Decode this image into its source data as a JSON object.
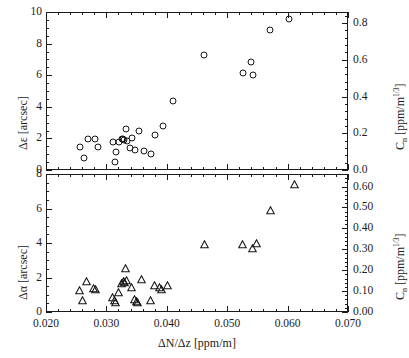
{
  "figure": {
    "background": "#ffffff",
    "foreground": "#1a1a1a"
  },
  "chart_data": [
    {
      "type": "scatter",
      "panel": "top",
      "title": "",
      "xlabel": "",
      "ylabel": "Δε [arcsec]",
      "y2label": "C_n [ppm/m^(1/3)]",
      "marker": "open-circle",
      "xlim": [
        0.02,
        0.07
      ],
      "ylim": [
        0,
        10
      ],
      "y2lim": [
        0.0,
        0.86
      ],
      "grid": false,
      "xticks": [
        0.02,
        0.03,
        0.04,
        0.05,
        0.06,
        0.07
      ],
      "yticks": [
        0,
        2,
        4,
        6,
        8,
        10
      ],
      "yticklabels": [
        "0",
        "2",
        "4",
        "6",
        "8",
        "10"
      ],
      "y2ticks": [
        0.0,
        0.2,
        0.4,
        0.6,
        0.8
      ],
      "y2ticklabels": [
        "0.0",
        "0.2",
        "0.4",
        "0.6",
        "0.8"
      ],
      "points": [
        {
          "x": 0.0255,
          "y": 1.55
        },
        {
          "x": 0.0262,
          "y": 0.8
        },
        {
          "x": 0.0268,
          "y": 2.05
        },
        {
          "x": 0.0279,
          "y": 2.05
        },
        {
          "x": 0.0284,
          "y": 1.55
        },
        {
          "x": 0.0309,
          "y": 1.85
        },
        {
          "x": 0.0312,
          "y": 0.55
        },
        {
          "x": 0.0315,
          "y": 1.2
        },
        {
          "x": 0.032,
          "y": 1.85
        },
        {
          "x": 0.0324,
          "y": 2.0
        },
        {
          "x": 0.0326,
          "y": 2.0
        },
        {
          "x": 0.0328,
          "y": 1.95
        },
        {
          "x": 0.033,
          "y": 2.65
        },
        {
          "x": 0.0333,
          "y": 1.9
        },
        {
          "x": 0.0337,
          "y": 1.45
        },
        {
          "x": 0.0341,
          "y": 2.1
        },
        {
          "x": 0.0345,
          "y": 1.3
        },
        {
          "x": 0.0353,
          "y": 2.55
        },
        {
          "x": 0.036,
          "y": 1.25
        },
        {
          "x": 0.0372,
          "y": 1.05
        },
        {
          "x": 0.0379,
          "y": 2.25
        },
        {
          "x": 0.0392,
          "y": 2.85
        },
        {
          "x": 0.0408,
          "y": 4.4
        },
        {
          "x": 0.046,
          "y": 7.35
        },
        {
          "x": 0.0524,
          "y": 6.2
        },
        {
          "x": 0.0537,
          "y": 6.9
        },
        {
          "x": 0.0541,
          "y": 6.05
        },
        {
          "x": 0.057,
          "y": 8.9
        },
        {
          "x": 0.06,
          "y": 9.65
        }
      ]
    },
    {
      "type": "scatter",
      "panel": "bottom",
      "title": "",
      "xlabel": "ΔN/Δz [ppm/m]",
      "ylabel": "Δα [arcsec]",
      "y2label": "C_n [ppm/m^(1/3)]",
      "marker": "open-triangle",
      "xlim": [
        0.02,
        0.07
      ],
      "ylim": [
        0,
        8
      ],
      "y2lim": [
        0.0,
        0.66
      ],
      "grid": false,
      "xticks": [
        0.02,
        0.03,
        0.04,
        0.05,
        0.06,
        0.07
      ],
      "xticklabels": [
        "0.020",
        "0.030",
        "0.040",
        "0.050",
        "0.060",
        "0.070"
      ],
      "yticks": [
        0,
        2,
        4,
        6,
        8
      ],
      "yticklabels": [
        "0",
        "2",
        "4",
        "6",
        "8"
      ],
      "y2ticks": [
        0.0,
        0.1,
        0.2,
        0.3,
        0.4,
        0.5,
        0.6
      ],
      "y2ticklabels": [
        "0.00",
        "0.10",
        "0.20",
        "0.30",
        "0.40",
        "0.50",
        "0.60"
      ],
      "points": [
        {
          "x": 0.0253,
          "y": 1.3
        },
        {
          "x": 0.0258,
          "y": 0.7
        },
        {
          "x": 0.0265,
          "y": 1.8
        },
        {
          "x": 0.0277,
          "y": 1.4
        },
        {
          "x": 0.0281,
          "y": 1.35
        },
        {
          "x": 0.0308,
          "y": 0.9
        },
        {
          "x": 0.0311,
          "y": 0.7
        },
        {
          "x": 0.0313,
          "y": 0.6
        },
        {
          "x": 0.0318,
          "y": 1.2
        },
        {
          "x": 0.0324,
          "y": 1.7
        },
        {
          "x": 0.0326,
          "y": 1.8
        },
        {
          "x": 0.0328,
          "y": 1.75
        },
        {
          "x": 0.033,
          "y": 2.6
        },
        {
          "x": 0.0332,
          "y": 1.9
        },
        {
          "x": 0.034,
          "y": 1.45
        },
        {
          "x": 0.0345,
          "y": 0.8
        },
        {
          "x": 0.0348,
          "y": 0.65
        },
        {
          "x": 0.035,
          "y": 0.6
        },
        {
          "x": 0.0356,
          "y": 1.95
        },
        {
          "x": 0.0372,
          "y": 0.75
        },
        {
          "x": 0.0378,
          "y": 1.6
        },
        {
          "x": 0.0386,
          "y": 1.45
        },
        {
          "x": 0.0389,
          "y": 1.35
        },
        {
          "x": 0.04,
          "y": 1.6
        },
        {
          "x": 0.0461,
          "y": 4.0
        },
        {
          "x": 0.0524,
          "y": 4.0
        },
        {
          "x": 0.0541,
          "y": 3.75
        },
        {
          "x": 0.0547,
          "y": 4.05
        },
        {
          "x": 0.057,
          "y": 5.95
        },
        {
          "x": 0.061,
          "y": 7.45
        }
      ]
    }
  ]
}
